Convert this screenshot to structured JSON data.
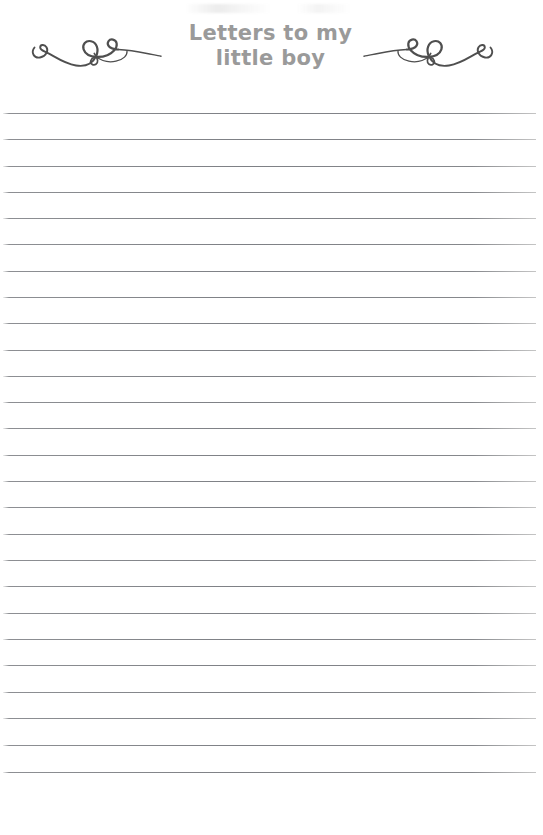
{
  "document": {
    "kind": "lined-stationery-page",
    "page_width": 543,
    "page_height": 835,
    "background_color": "#ffffff"
  },
  "header": {
    "title_line_1": "Letters to my",
    "title_line_2": "little boy",
    "title_color": "#9a9a9a",
    "ornament_left": "flourish-ornament-left",
    "ornament_right": "flourish-ornament-right",
    "ornament_color": "#4f4f4f"
  },
  "body": {
    "rule_color": "#84868a",
    "rule_count": 26,
    "rule_spacing_px": 26.3,
    "first_rule_y": 113,
    "rule_left_x": 3,
    "rule_right_x": 536,
    "rules_y": [
      113,
      139,
      166,
      192,
      218,
      244,
      271,
      297,
      323,
      350,
      376,
      402,
      428,
      455,
      481,
      507,
      534,
      560,
      586,
      613,
      639,
      665,
      692,
      718,
      745,
      772
    ]
  }
}
